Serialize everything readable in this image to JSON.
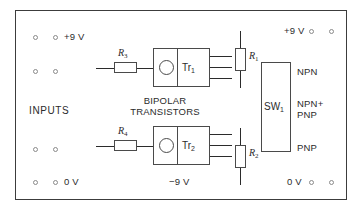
{
  "diagram": {
    "board": {
      "border_color": "#3c3c3c",
      "background": "#ffffff"
    }
  },
  "labels": {
    "supply_pos_left": "+9 V",
    "supply_zero_left": "0 V",
    "supply_pos_right": "+9 V",
    "supply_zero_right": "0 V",
    "supply_neg_center": "−9 V",
    "inputs": "INPUTS",
    "bipolar_line1": "BIPOLAR",
    "bipolar_line2": "TRANSISTORS",
    "mode_npn": "NPN",
    "mode_npn_pnp_line1": "NPN+",
    "mode_npn_pnp_line2": "PNP",
    "mode_pnp": "PNP"
  },
  "components": {
    "transistor_1": {
      "ref": "Tr",
      "sub": "1"
    },
    "transistor_2": {
      "ref": "Tr",
      "sub": "2"
    },
    "resistor_1": {
      "ref": "R",
      "sub": "1"
    },
    "resistor_2": {
      "ref": "R",
      "sub": "2"
    },
    "resistor_3": {
      "ref": "R",
      "sub": "3"
    },
    "resistor_4": {
      "ref": "R",
      "sub": "4"
    },
    "switch_1": {
      "ref": "SW",
      "sub": "1"
    }
  },
  "sockets": {
    "count": 12,
    "groups": [
      {
        "name": "left-supply-pos",
        "label": "+9 V",
        "positions": [
          [
            35,
            37
          ],
          [
            55,
            37
          ]
        ]
      },
      {
        "name": "left-input",
        "label": "",
        "positions": [
          [
            35,
            71
          ],
          [
            55,
            71
          ]
        ]
      },
      {
        "name": "left-input-lower",
        "label": "",
        "positions": [
          [
            35,
            149
          ],
          [
            55,
            149
          ]
        ]
      },
      {
        "name": "left-supply-zero",
        "label": "0 V",
        "positions": [
          [
            35,
            182
          ],
          [
            55,
            182
          ]
        ]
      },
      {
        "name": "right-supply-pos",
        "label": "+9 V",
        "positions": [
          [
            311,
            31
          ],
          [
            330,
            31
          ]
        ]
      },
      {
        "name": "right-supply-zero",
        "label": "0 V",
        "positions": [
          [
            311,
            182
          ],
          [
            330,
            182
          ]
        ]
      }
    ]
  }
}
